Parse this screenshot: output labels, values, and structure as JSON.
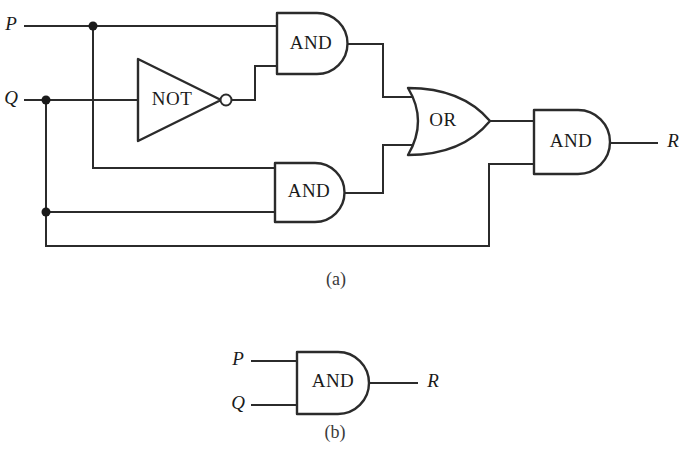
{
  "figure": {
    "background_color": "#ffffff",
    "stroke_color": "#2b2b2b",
    "text_color": "#1a1a1a",
    "parts": [
      {
        "id": "a",
        "caption": "(a)"
      },
      {
        "id": "b",
        "caption": "(b)"
      }
    ]
  },
  "part_a": {
    "caption": "(a)",
    "inputs": [
      {
        "name": "input-p",
        "label": "P"
      },
      {
        "name": "input-q",
        "label": "Q"
      }
    ],
    "outputs": [
      {
        "name": "output-r",
        "label": "R"
      }
    ],
    "gates": [
      {
        "id": "and-top",
        "type": "AND",
        "label": "AND"
      },
      {
        "id": "not-1",
        "type": "NOT",
        "label": "NOT"
      },
      {
        "id": "and-bottom",
        "type": "AND",
        "label": "AND"
      },
      {
        "id": "or-1",
        "type": "OR",
        "label": "OR"
      },
      {
        "id": "and-output",
        "type": "AND",
        "label": "AND"
      }
    ],
    "junction_count": 3
  },
  "part_b": {
    "caption": "(b)",
    "inputs": [
      {
        "name": "input-p",
        "label": "P"
      },
      {
        "name": "input-q",
        "label": "Q"
      }
    ],
    "outputs": [
      {
        "name": "output-r",
        "label": "R"
      }
    ],
    "gates": [
      {
        "id": "and-single",
        "type": "AND",
        "label": "AND"
      }
    ]
  }
}
